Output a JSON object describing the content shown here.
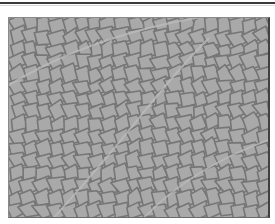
{
  "image": {
    "subject": "leaf venation network micrograph",
    "colors": {
      "cell_fill": "#a9a9a9",
      "vein": "#767676",
      "major_vein": "#bdbdbd",
      "frame": "#404040",
      "background": "#ffffff"
    },
    "grid": {
      "cols": 20,
      "rows": 16,
      "seed": 7
    }
  }
}
